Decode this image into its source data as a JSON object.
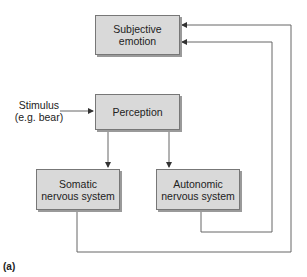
{
  "diagram": {
    "nodes": {
      "subjective_emotion": {
        "line1": "Subjective",
        "line2": "emotion"
      },
      "perception": {
        "line1": "Perception"
      },
      "somatic": {
        "line1": "Somatic",
        "line2": "nervous system"
      },
      "autonomic": {
        "line1": "Autonomic",
        "line2": "nervous system"
      }
    },
    "stimulus": {
      "line1": "Stimulus",
      "line2": "(e.g. bear)"
    },
    "panel_label": "(a)",
    "edges": [
      {
        "from": "stimulus",
        "to": "perception"
      },
      {
        "from": "perception",
        "to": "somatic"
      },
      {
        "from": "perception",
        "to": "autonomic"
      },
      {
        "from": "somatic",
        "to": "subjective_emotion"
      },
      {
        "from": "autonomic",
        "to": "subjective_emotion"
      }
    ],
    "colors": {
      "box_fill": "#d9d9d9",
      "line": "#555555"
    }
  }
}
